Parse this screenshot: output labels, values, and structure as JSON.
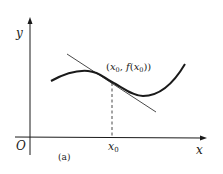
{
  "figure": {
    "axis_labels": {
      "y": "y",
      "x": "x",
      "origin": "O"
    },
    "point_label": {
      "open": "(",
      "x_var": "x",
      "x_sub": "0",
      "comma": ", ",
      "f": "f",
      "paren_open": "(",
      "x_var2": "x",
      "x_sub2": "0",
      "close": "))"
    },
    "x_tick": {
      "var": "x",
      "sub": "0"
    },
    "caption": "(a)",
    "colors": {
      "ink": "#1a1a1a",
      "background": "#ffffff"
    }
  }
}
